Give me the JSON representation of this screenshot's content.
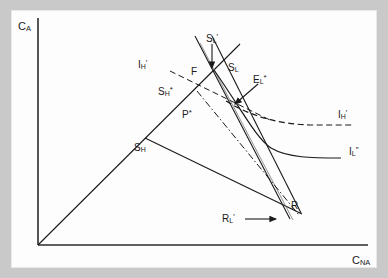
{
  "figure": {
    "type": "economic-diagram",
    "background_color": "#c9c9c9",
    "panel_color": "#fdfdfd",
    "line_color": "#1a1a1a",
    "axes": {
      "y_label_main": "C",
      "y_label_sub": "A",
      "x_label_main": "C",
      "x_label_sub": "NA",
      "origin": [
        38,
        245
      ]
    },
    "labels": [
      {
        "id": "y-axis-label",
        "main": "C",
        "sub": "A",
        "sup": "",
        "x": 18,
        "y": 21
      },
      {
        "id": "x-axis-label",
        "main": "C",
        "sub": "NA",
        "sup": "",
        "x": 352,
        "y": 255
      },
      {
        "id": "label-sl-prime",
        "main": "S",
        "sub": "L",
        "sup": "′",
        "x": 206,
        "y": 33
      },
      {
        "id": "label-sl",
        "main": "S",
        "sub": "L",
        "sup": "",
        "x": 228,
        "y": 63
      },
      {
        "id": "label-el-star",
        "main": "E",
        "sub": "L",
        "sup": "*",
        "x": 253,
        "y": 74
      },
      {
        "id": "label-ih-prime-left",
        "main": "I",
        "sub": "H",
        "sup": "′",
        "x": 138,
        "y": 59
      },
      {
        "id": "label-sh-star",
        "main": "S",
        "sub": "H",
        "sup": "*",
        "x": 158,
        "y": 86
      },
      {
        "id": "label-f",
        "main": "F",
        "sub": "",
        "sup": "",
        "x": 191,
        "y": 67
      },
      {
        "id": "label-p-star",
        "main": "P",
        "sub": "",
        "sup": "*",
        "x": 182,
        "y": 109
      },
      {
        "id": "label-sh",
        "main": "S",
        "sub": "H",
        "sup": "",
        "x": 134,
        "y": 143
      },
      {
        "id": "label-ih-prime-right",
        "main": "I",
        "sub": "H",
        "sup": "′",
        "x": 338,
        "y": 109
      },
      {
        "id": "label-il-dprime",
        "main": "I",
        "sub": "L",
        "sup": "″",
        "x": 349,
        "y": 146
      },
      {
        "id": "label-r",
        "main": "R",
        "sub": "",
        "sup": "",
        "x": 291,
        "y": 201
      },
      {
        "id": "label-rl-prime",
        "main": "R",
        "sub": "L",
        "sup": "′",
        "x": 222,
        "y": 222
      }
    ],
    "geometry": {
      "axis_y": {
        "x1": 38,
        "y1": 18,
        "x2": 38,
        "y2": 245
      },
      "axis_x": {
        "x1": 38,
        "y1": 245,
        "x2": 368,
        "y2": 245
      },
      "ray_45deg": {
        "x1": 38,
        "y1": 245,
        "x2": 240,
        "y2": 44
      },
      "sh_to_r": {
        "x1": 145,
        "y1": 138,
        "x2": 300,
        "y2": 213
      },
      "budget_sl_prime": {
        "x1": 195,
        "y1": 36,
        "x2": 290,
        "y2": 218
      },
      "budget_sl": {
        "x1": 211,
        "y1": 36,
        "x2": 300,
        "y2": 212
      },
      "budget_sl_thin": {
        "x1": 199,
        "y1": 42,
        "x2": 292,
        "y2": 219
      },
      "dashdot_p_to_r": {
        "x1": 198,
        "y1": 92,
        "x2": 298,
        "y2": 214
      },
      "dash_sh_star": {
        "x1": 171,
        "y1": 72,
        "x2": 270,
        "y2": 120
      },
      "curve_ih_prime_dashed": "M 233,106 C 258,118 282,124 310,125 L 352,125",
      "curve_il_dprime": "M 216,73 C 244,112 258,140 272,149 C 288,158 312,158 340,158",
      "arrow_sl_prime": {
        "x1": 212,
        "y1": 45,
        "x2": 212,
        "y2": 68
      },
      "arrow_el_star": {
        "x1": 255,
        "y1": 85,
        "x2": 233,
        "y2": 105
      },
      "arrow_rl_prime": {
        "x1": 245,
        "y1": 219,
        "x2": 275,
        "y2": 219
      }
    }
  }
}
